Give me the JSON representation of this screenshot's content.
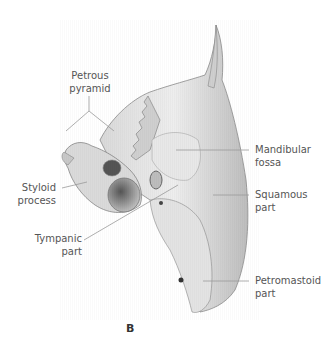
{
  "figure": {
    "panel_letter": "B",
    "labels": [
      {
        "id": "petrous-pyramid",
        "text_lines": [
          "Petrous",
          "pyramid"
        ]
      },
      {
        "id": "mandibular-fossa",
        "text_lines": [
          "Mandibular",
          "fossa"
        ]
      },
      {
        "id": "styloid-process",
        "text_lines": [
          "Styloid",
          "process"
        ]
      },
      {
        "id": "squamous-part",
        "text_lines": [
          "Squamous",
          "part"
        ]
      },
      {
        "id": "tympanic-part",
        "text_lines": [
          "Tympanic",
          "part"
        ]
      },
      {
        "id": "petromastoid-part",
        "text_lines": [
          "Petromastoid",
          "part"
        ]
      }
    ]
  }
}
